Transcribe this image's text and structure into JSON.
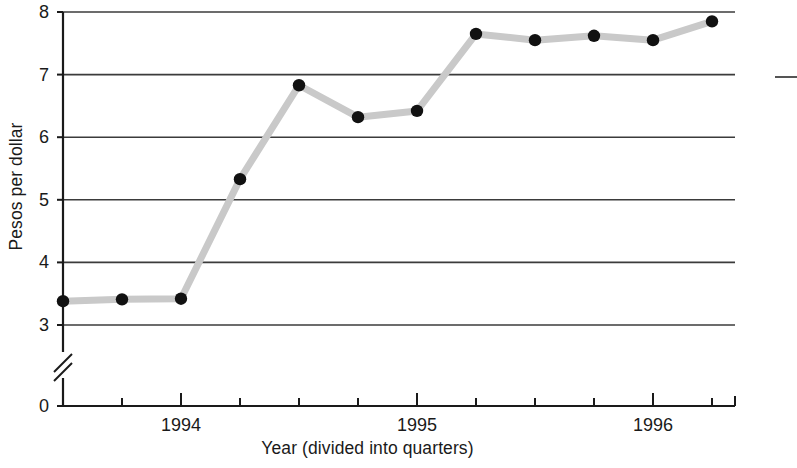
{
  "chart_data": {
    "type": "line",
    "title": "",
    "xlabel": "Year (divided into quarters)",
    "ylabel": "Pesos per dollar",
    "x": [
      "1993 Q3",
      "1993 Q4",
      "1994 Q1",
      "1994 Q2",
      "1994 Q3",
      "1994 Q4",
      "1995 Q1",
      "1995 Q2",
      "1995 Q3",
      "1995 Q4",
      "1996 Q1",
      "1996 Q2"
    ],
    "values": [
      3.38,
      3.41,
      3.42,
      5.33,
      6.83,
      6.32,
      6.42,
      7.65,
      7.55,
      7.62,
      7.55,
      7.85
    ],
    "ylim": [
      0,
      8
    ],
    "y_ticks": [
      "0",
      "3",
      "4",
      "5",
      "6",
      "7",
      "8"
    ],
    "y_tick_values": [
      0,
      3,
      4,
      5,
      6,
      7,
      8
    ],
    "x_tick_labels": [
      "1994",
      "1995",
      "1996"
    ],
    "x_tick_label_indices": [
      2,
      6,
      10
    ],
    "axis_break": true,
    "axis_break_note": "y-axis broken between 0 and 3",
    "grid": "horizontal",
    "legend": "none",
    "marker": "filled-circle",
    "line_color": "#c9c9c9",
    "marker_color": "#111111",
    "grid_color": "#3b3b3b",
    "axis_color": "#1a1a1a",
    "background": "#ffffff"
  },
  "axes": {
    "y_title": "Pesos per dollar",
    "x_title": "Year (divided into quarters)"
  }
}
